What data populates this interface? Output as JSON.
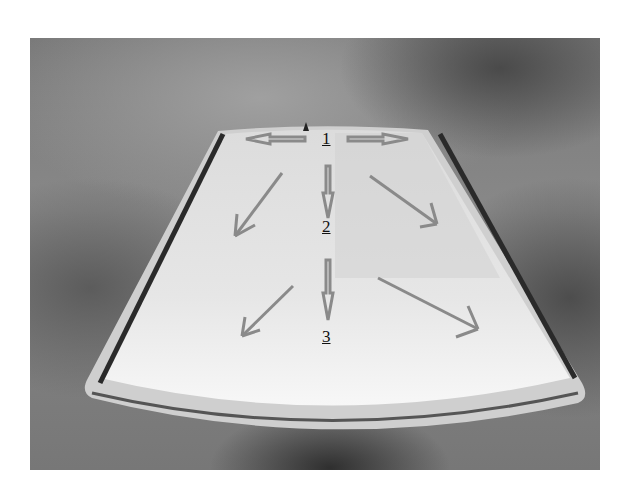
{
  "image": {
    "description": "Grayscale photo of a trapezoidal curved plate (e.g. glass/film) with arrows indicating spreading/flow directions from region 1 at top, to 2 and 3",
    "colors": {
      "background": "#ffffff",
      "plate": "#e8e8e8",
      "arrow": "#8a8a8a",
      "border_stripe": "#2a2a2a"
    }
  },
  "labels": {
    "region_1": "1",
    "region_2": "2",
    "region_3": "3"
  },
  "arrows": [
    {
      "name": "arrow-left-1",
      "style": "outlined",
      "direction": "left"
    },
    {
      "name": "arrow-right-1",
      "style": "outlined",
      "direction": "right"
    },
    {
      "name": "arrow-down-1-2",
      "style": "outlined",
      "direction": "down"
    },
    {
      "name": "arrow-down-2-3",
      "style": "outlined",
      "direction": "down"
    },
    {
      "name": "arrow-diag-left-upper",
      "style": "line",
      "direction": "down-left"
    },
    {
      "name": "arrow-diag-right-upper",
      "style": "line",
      "direction": "down-right"
    },
    {
      "name": "arrow-diag-left-lower",
      "style": "line",
      "direction": "down-left"
    },
    {
      "name": "arrow-diag-right-lower",
      "style": "line",
      "direction": "down-right"
    }
  ]
}
